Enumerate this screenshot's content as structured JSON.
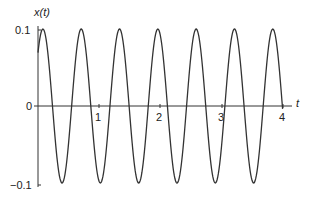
{
  "chart_data": {
    "type": "line",
    "title": "",
    "xlabel": "t",
    "ylabel": "x(t)",
    "xlim": [
      0,
      4
    ],
    "ylim": [
      -0.1,
      0.1
    ],
    "x_ticks": [
      "1",
      "2",
      "3",
      "4"
    ],
    "y_ticks": [
      "0.1",
      "0",
      "−0.1"
    ],
    "grid": false,
    "legend": null,
    "series": [
      {
        "name": "x(t)",
        "function": "0.1*cos(2*pi*1.6*(t-0.08))",
        "amplitude": 0.1,
        "frequency_hz": 1.6,
        "peak_times": [
          0.08,
          0.7,
          1.33,
          1.95,
          2.58,
          3.2,
          3.83
        ],
        "trough_values": -0.1,
        "peak_values": 0.1,
        "color": "#333333"
      }
    ]
  },
  "labels": {
    "y_axis": "x(t)",
    "x_axis": "t",
    "y_top": "0.1",
    "y_zero": "0",
    "y_bottom": "−0.1",
    "x1": "1",
    "x2": "2",
    "x3": "3",
    "x4": "4"
  }
}
